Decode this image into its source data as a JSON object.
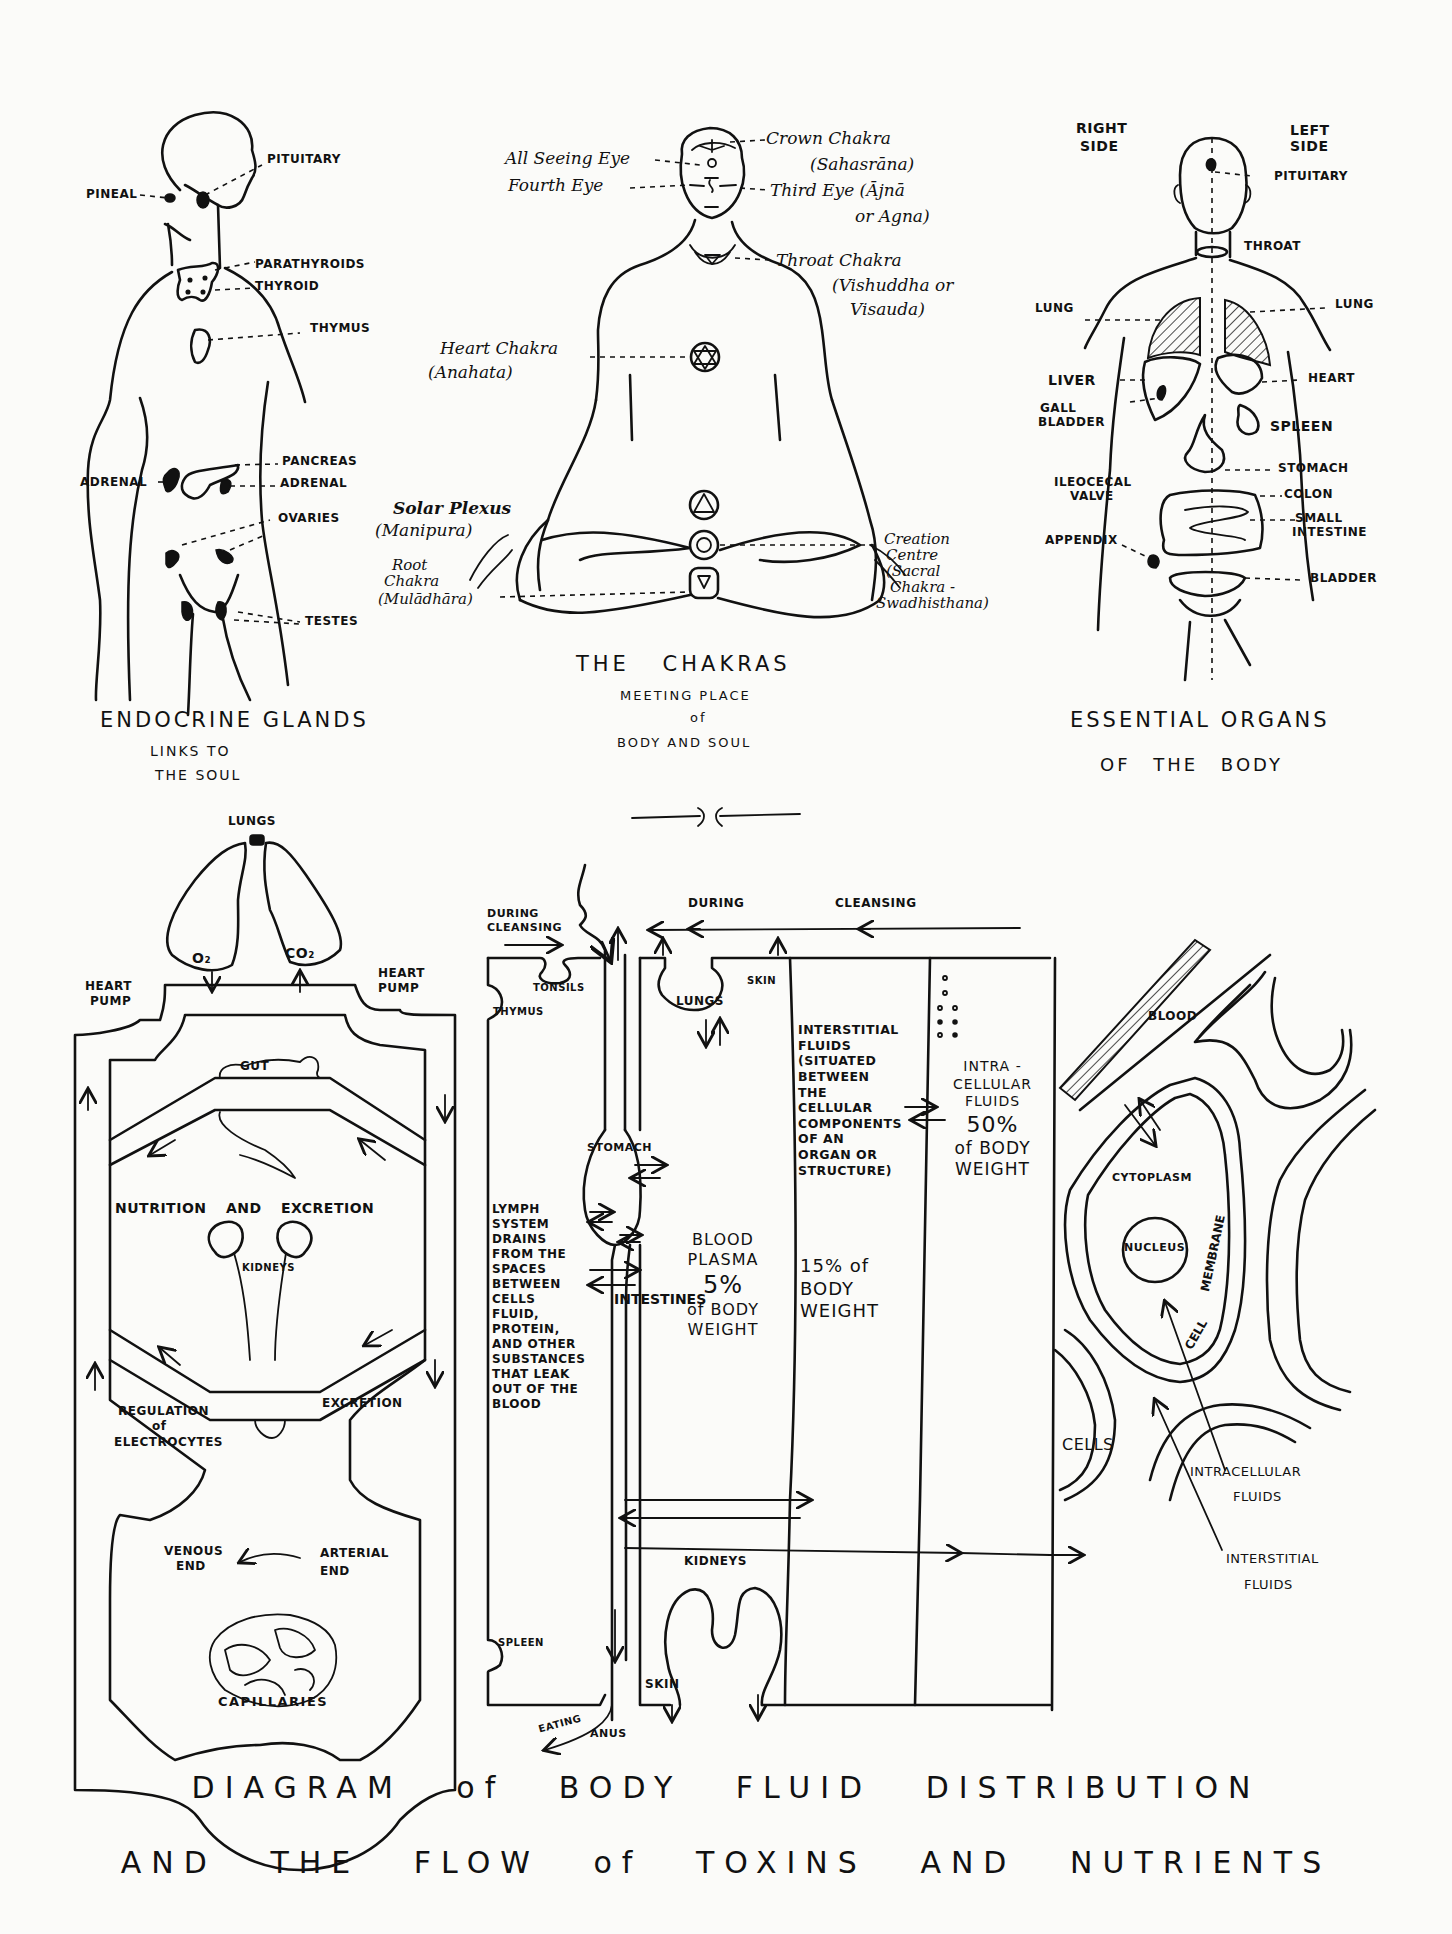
{
  "endocrine": {
    "title": "ENDOCRINE GLANDS",
    "subtitle_1": "LINKS TO",
    "subtitle_2": "THE SOUL",
    "labels": {
      "pituitary": "PITUITARY",
      "pineal": "PINEAL",
      "parathyroids": "PARATHYROIDS",
      "thyroid": "THYROID",
      "thymus": "THYMUS",
      "pancreas": "PANCREAS",
      "adrenal_left": "ADRENAL",
      "adrenal_right": "ADRENAL",
      "ovaries": "OVARIES",
      "testes": "TESTES"
    }
  },
  "chakras": {
    "title": "THE CHAKRAS",
    "subtitle_1": "MEETING PLACE",
    "subtitle_2": "of",
    "subtitle_3": "BODY AND SOUL",
    "labels": {
      "all_seeing_eye": "All Seeing Eye",
      "fourth_eye": "Fourth Eye",
      "crown_1": "Crown Chakra",
      "crown_2": "(Sahasrāna)",
      "third_eye_1": "Third Eye (Ājnā",
      "third_eye_2": "or Agna)",
      "throat_1": "Throat Chakra",
      "throat_2": "(Vishuddha or",
      "throat_3": "Visauda)",
      "heart_1": "Heart Chakra",
      "heart_2": "(Anahata)",
      "solar_1": "Solar Plexus",
      "solar_2": "(Manipura)",
      "root_1": "Root",
      "root_2": "Chakra",
      "root_3": "(Mulādhāra)",
      "creation_1": "Creation",
      "creation_2": "Centre",
      "creation_3": "(Sacral",
      "creation_4": "Chakra -",
      "creation_5": "Swadhisthana)"
    }
  },
  "organs": {
    "title": "ESSENTIAL ORGANS",
    "subtitle": "OF THE BODY",
    "labels": {
      "right_side_1": "RIGHT",
      "right_side_2": "SIDE",
      "left_side_1": "LEFT",
      "left_side_2": "SIDE",
      "pituitary": "PITUITARY",
      "throat": "THROAT",
      "lung_right": "LUNG",
      "lung_left": "LUNG",
      "liver": "LIVER",
      "heart": "HEART",
      "gall_1": "GALL",
      "gall_2": "BLADDER",
      "spleen": "SPLEEN",
      "stomach": "STOMACH",
      "ileocecal_1": "ILEOCECAL",
      "ileocecal_2": "VALVE",
      "colon": "COLON",
      "small_1": "SMALL",
      "small_2": "INTESTINE",
      "appendix": "APPENDIX",
      "bladder": "BLADDER"
    }
  },
  "circulation": {
    "labels": {
      "lungs": "LUNGS",
      "o2": "O₂",
      "co2": "CO₂",
      "heart_pump_left_1": "HEART",
      "heart_pump_left_2": "PUMP",
      "heart_pump_right_1": "HEART",
      "heart_pump_right_2": "PUMP",
      "gut": "GUT",
      "nutrition": "NUTRITION AND EXCRETION",
      "kidneys": "KIDNEYS",
      "regulation_1": "REGULATION",
      "regulation_2": "of",
      "regulation_3": "ELECTROCYTES",
      "excretion": "EXCRETION",
      "venous_1": "VENOUS",
      "venous_2": "END",
      "arterial_1": "ARTERIAL",
      "arterial_2": "END",
      "capillaries": "CAPILLARIES"
    }
  },
  "fluids": {
    "labels": {
      "during_cleansing_1": "DURING",
      "during_cleansing_2": "CLEANSING",
      "top_during": "DURING",
      "top_cleansing": "CLEANSING",
      "tonsils": "TONSILS",
      "thymus": "THYMUS",
      "lungs": "LUNGS",
      "skin_top": "SKIN",
      "stomach": "STOMACH",
      "intestines": "INTESTINES",
      "spleen": "SPLEEN",
      "kidneys": "KIDNEYS",
      "skin_bottom": "SKIN",
      "eating": "EATING",
      "anus": "ANUS"
    },
    "lymph_text": [
      "LYMPH",
      "SYSTEM",
      "DRAINS",
      "FROM THE",
      "SPACES",
      "BETWEEN",
      "CELLS",
      "FLUID,",
      "PROTEIN,",
      "AND OTHER",
      "SUBSTANCES",
      "THAT LEAK",
      "OUT OF THE",
      "BLOOD"
    ],
    "blood_plasma": {
      "line1": "BLOOD",
      "line2": "PLASMA",
      "percent": "5%",
      "line3": "of BODY",
      "line4": "WEIGHT"
    },
    "interstitial": {
      "lines": [
        "INTERSTITIAL",
        "FLUIDS",
        "(SITUATED",
        "BETWEEN",
        "THE",
        "CELLULAR",
        "COMPONENTS",
        "OF AN",
        "ORGAN OR",
        "STRUCTURE)"
      ],
      "percent_line1": "15% of",
      "percent_line2": "BODY",
      "percent_line3": "WEIGHT"
    },
    "intracellular": {
      "line1": "INTRA -",
      "line2": "CELLULAR",
      "line3": "FLUIDS",
      "percent": "50%",
      "line4": "of BODY",
      "line5": "WEIGHT"
    }
  },
  "cell": {
    "labels": {
      "blood": "BLOOD",
      "cytoplasm": "CYTOPLASM",
      "nucleus": "NUCLEUS",
      "membrane": "MEMBRANE",
      "cell": "CELL",
      "cells": "CELLS",
      "intracellular_1": "INTRACELLULAR",
      "intracellular_2": "FLUIDS",
      "interstitial_1": "INTERSTITIAL",
      "interstitial_2": "FLUIDS"
    }
  },
  "footer": {
    "title_line1": "DIAGRAM of BODY FLUID DISTRIBUTION",
    "title_line2": "AND THE FLOW of TOXINS AND NUTRIENTS"
  }
}
